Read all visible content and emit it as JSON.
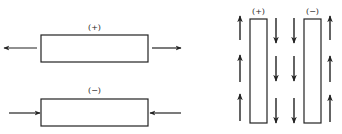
{
  "diagram": {
    "stroke_color": "#222222",
    "left_panel": {
      "top": {
        "label": "(+)",
        "description": "Bar under tension; arrows pointing outward",
        "rect": {
          "x": 41,
          "y": 35,
          "w": 107,
          "h": 27
        },
        "arrows": [
          {
            "x1": 37,
            "y1": 48,
            "x2": 4,
            "y2": 48,
            "direction": "left"
          },
          {
            "x1": 152,
            "y1": 48,
            "x2": 181,
            "y2": 48,
            "direction": "right"
          }
        ]
      },
      "bottom": {
        "label": "(−)",
        "description": "Bar under compression; arrows pointing inward",
        "rect": {
          "x": 41,
          "y": 99,
          "w": 107,
          "h": 27
        },
        "arrows": [
          {
            "x1": 9,
            "y1": 113,
            "x2": 40,
            "y2": 113,
            "direction": "right"
          },
          {
            "x1": 181,
            "y1": 113,
            "x2": 150,
            "y2": 113,
            "direction": "left"
          }
        ]
      }
    },
    "right_panel": {
      "plus_bar": {
        "label": "(+)",
        "rect": {
          "x": 250,
          "y": 19,
          "w": 17,
          "h": 104
        }
      },
      "minus_bar": {
        "label": "(−)",
        "rect": {
          "x": 304,
          "y": 19,
          "w": 17,
          "h": 104
        }
      },
      "arrow_columns": [
        {
          "x": 240,
          "direction": "up"
        },
        {
          "x": 276,
          "direction": "down"
        },
        {
          "x": 294,
          "direction": "down"
        },
        {
          "x": 330,
          "direction": "up"
        }
      ],
      "arrow_rows": [
        {
          "y_top": 16,
          "y_bottom": 40
        },
        {
          "y_top": 55,
          "y_bottom": 82
        },
        {
          "y_top": 96,
          "y_bottom": 121
        }
      ]
    }
  }
}
